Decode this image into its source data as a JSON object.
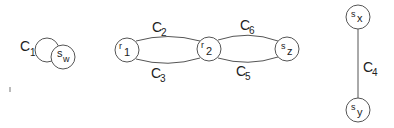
{
  "diagram": {
    "type": "graph",
    "nodes": [
      {
        "id": "s_w",
        "base": "s",
        "sub": "w"
      },
      {
        "id": "r_1",
        "base": "r",
        "sub": "1"
      },
      {
        "id": "r_2",
        "base": "r",
        "sub": "2"
      },
      {
        "id": "s_z",
        "base": "s",
        "sub": "z"
      },
      {
        "id": "s_x",
        "base": "s",
        "sub": "x"
      },
      {
        "id": "s_y",
        "base": "s",
        "sub": "y"
      }
    ],
    "edges": [
      {
        "id": "C1",
        "base": "C",
        "sub": "1",
        "from": "s_w",
        "to": "s_w",
        "kind": "self-loop"
      },
      {
        "id": "C2",
        "base": "C",
        "sub": "2",
        "from": "r_1",
        "to": "r_2",
        "kind": "upper-arc"
      },
      {
        "id": "C3",
        "base": "C",
        "sub": "3",
        "from": "r_1",
        "to": "r_2",
        "kind": "lower-arc"
      },
      {
        "id": "C6",
        "base": "C",
        "sub": "6",
        "from": "r_2",
        "to": "s_z",
        "kind": "upper-arc"
      },
      {
        "id": "C5",
        "base": "C",
        "sub": "5",
        "from": "r_2",
        "to": "s_z",
        "kind": "lower-arc"
      },
      {
        "id": "C4",
        "base": "C",
        "sub": "4",
        "from": "s_x",
        "to": "s_y",
        "kind": "straight"
      }
    ]
  },
  "labels": {
    "sw": {
      "base": "s",
      "sub": "w"
    },
    "r1": {
      "base": "r",
      "sub": "1"
    },
    "r2": {
      "base": "r",
      "sub": "2"
    },
    "sz": {
      "base": "s",
      "sub": "z"
    },
    "sx": {
      "base": "s",
      "sub": "x"
    },
    "sy": {
      "base": "s",
      "sub": "y"
    },
    "c1": {
      "base": "C",
      "sub": "1"
    },
    "c2": {
      "base": "C",
      "sub": "2"
    },
    "c3": {
      "base": "C",
      "sub": "3"
    },
    "c4": {
      "base": "C",
      "sub": "4"
    },
    "c5": {
      "base": "C",
      "sub": "5"
    },
    "c6": {
      "base": "C",
      "sub": "6"
    }
  }
}
